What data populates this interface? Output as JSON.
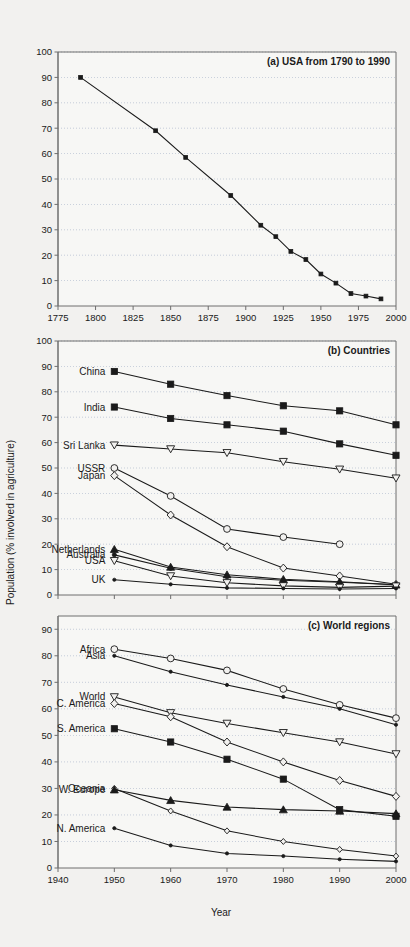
{
  "figure": {
    "y_axis_label": "Population (% involved in agriculture)",
    "x_axis_label": "Year"
  },
  "chart_data": [
    {
      "type": "line",
      "panel_id": "a",
      "title": "(a) USA from 1790 to 1990",
      "xlabel": "",
      "ylabel": "Population (% involved in agriculture)",
      "xlim": [
        1775,
        2000
      ],
      "ylim": [
        0,
        100
      ],
      "xticks": [
        1775,
        1800,
        1825,
        1850,
        1875,
        1900,
        1925,
        1950,
        1975,
        2000
      ],
      "yticks": [
        0,
        10,
        20,
        30,
        40,
        50,
        60,
        70,
        80,
        90,
        100
      ],
      "grid": "horizontal-dotted",
      "legend": "none",
      "series": [
        {
          "name": "USA",
          "marker": "filled-square-small",
          "x": [
            1790,
            1840,
            1860,
            1890,
            1910,
            1920,
            1930,
            1940,
            1950,
            1960,
            1970,
            1980,
            1990
          ],
          "values": [
            90.0,
            69.0,
            58.5,
            43.5,
            31.8,
            27.3,
            21.5,
            18.3,
            12.6,
            9.0,
            4.9,
            3.9,
            2.8
          ]
        }
      ]
    },
    {
      "type": "line",
      "panel_id": "b",
      "title": "(b) Countries",
      "xlabel": "",
      "ylabel": "Population (% involved in agriculture)",
      "xlim": [
        1940,
        2000
      ],
      "ylim": [
        0,
        100
      ],
      "xticks": [
        1940,
        1950,
        1960,
        1970,
        1980,
        1990,
        2000
      ],
      "yticks": [
        0,
        10,
        20,
        30,
        40,
        50,
        60,
        70,
        80,
        90,
        100
      ],
      "grid": "horizontal-dotted",
      "legend": "inline-left-labels",
      "categories": [
        1950,
        1960,
        1970,
        1980,
        1990,
        2000
      ],
      "series": [
        {
          "name": "China",
          "marker": "filled-square",
          "label_y": 88.0,
          "x": [
            1950,
            1960,
            1970,
            1980,
            1990,
            2000
          ],
          "values": [
            88.0,
            83.0,
            78.5,
            74.5,
            72.5,
            67.0
          ]
        },
        {
          "name": "India",
          "marker": "filled-square",
          "label_y": 74.0,
          "x": [
            1950,
            1960,
            1970,
            1980,
            1990,
            2000
          ],
          "values": [
            74.0,
            69.5,
            67.0,
            64.5,
            59.5,
            55.0
          ]
        },
        {
          "name": "Sri Lanka",
          "marker": "open-triangle-down",
          "label_y": 59.0,
          "x": [
            1950,
            1960,
            1970,
            1980,
            1990,
            2000
          ],
          "values": [
            59.0,
            57.5,
            56.0,
            52.5,
            49.5,
            46.0
          ]
        },
        {
          "name": "USSR",
          "marker": "open-circle",
          "label_y": 50.0,
          "x": [
            1950,
            1960,
            1970,
            1980,
            1990
          ],
          "values": [
            50.0,
            39.0,
            26.0,
            22.8,
            20.0
          ]
        },
        {
          "name": "Japan",
          "marker": "open-diamond",
          "label_y": 47.0,
          "x": [
            1950,
            1960,
            1970,
            1980,
            1990,
            2000
          ],
          "values": [
            47.0,
            31.5,
            19.0,
            10.6,
            7.5,
            4.2
          ]
        },
        {
          "name": "Netherlands",
          "marker": "filled-triangle-up",
          "label_y": 18.0,
          "x": [
            1950,
            1960,
            1970,
            1980,
            1990,
            2000
          ],
          "values": [
            18.0,
            11.0,
            8.0,
            6.2,
            5.2,
            4.0
          ]
        },
        {
          "name": "Australia",
          "marker": "filled-circle-small",
          "label_y": 15.8,
          "x": [
            1950,
            1960,
            1970,
            1980,
            1990,
            2000
          ],
          "values": [
            15.8,
            10.5,
            7.2,
            5.8,
            5.0,
            4.0
          ]
        },
        {
          "name": "USA",
          "marker": "open-triangle-down",
          "label_y": 13.5,
          "x": [
            1950,
            1960,
            1970,
            1980,
            1990,
            2000
          ],
          "values": [
            13.5,
            7.5,
            4.8,
            3.6,
            3.0,
            3.5
          ]
        },
        {
          "name": "UK",
          "marker": "filled-dot",
          "label_y": 6.0,
          "x": [
            1950,
            1960,
            1970,
            1980,
            1990,
            2000
          ],
          "values": [
            6.0,
            4.2,
            2.8,
            2.6,
            2.4,
            2.6
          ]
        }
      ]
    },
    {
      "type": "line",
      "panel_id": "c",
      "title": "(c)  World regions",
      "xlabel": "Year",
      "ylabel": "Population (% involved in agriculture)",
      "xlim": [
        1940,
        2000
      ],
      "ylim": [
        0,
        95
      ],
      "xticks": [
        1940,
        1950,
        1960,
        1970,
        1980,
        1990,
        2000
      ],
      "yticks": [
        0,
        10,
        20,
        30,
        40,
        50,
        60,
        70,
        80,
        90
      ],
      "grid": "horizontal-dotted",
      "legend": "inline-left-labels",
      "categories": [
        1950,
        1960,
        1970,
        1980,
        1990,
        2000
      ],
      "series": [
        {
          "name": "Africa",
          "marker": "open-circle",
          "label_y": 82.5,
          "x": [
            1950,
            1960,
            1970,
            1980,
            1990,
            2000
          ],
          "values": [
            82.5,
            79.0,
            74.5,
            67.5,
            61.5,
            56.5
          ]
        },
        {
          "name": "Asia",
          "marker": "filled-dot",
          "label_y": 80.0,
          "x": [
            1950,
            1960,
            1970,
            1980,
            1990,
            2000
          ],
          "values": [
            80.0,
            74.0,
            69.0,
            64.5,
            60.0,
            54.0
          ]
        },
        {
          "name": "World",
          "marker": "open-triangle-down",
          "label_y": 64.5,
          "x": [
            1950,
            1960,
            1970,
            1980,
            1990,
            2000
          ],
          "values": [
            64.5,
            58.5,
            54.5,
            51.0,
            47.5,
            43.0
          ]
        },
        {
          "name": "C. America",
          "marker": "open-diamond",
          "label_y": 62.0,
          "x": [
            1950,
            1960,
            1970,
            1980,
            1990,
            2000
          ],
          "values": [
            62.0,
            57.0,
            47.5,
            40.0,
            33.0,
            27.0
          ]
        },
        {
          "name": "S. America",
          "marker": "filled-square",
          "label_y": 52.5,
          "x": [
            1950,
            1960,
            1970,
            1980,
            1990,
            2000
          ],
          "values": [
            52.5,
            47.5,
            41.0,
            33.5,
            22.0,
            19.5
          ]
        },
        {
          "name": "Oceania",
          "marker": "open-diamond-small",
          "label_y": 30.0,
          "x": [
            1950,
            1960,
            1970,
            1980,
            1990,
            2000
          ],
          "values": [
            30.0,
            21.5,
            14.0,
            10.0,
            7.0,
            4.5
          ]
        },
        {
          "name": "W. Europe",
          "marker": "filled-triangle-up",
          "label_y": 29.5,
          "x": [
            1950,
            1960,
            1970,
            1980,
            1990,
            2000
          ],
          "values": [
            29.5,
            25.5,
            23.0,
            22.0,
            21.5,
            20.5
          ]
        },
        {
          "name": "N. America",
          "marker": "filled-dot",
          "label_y": 15.0,
          "x": [
            1950,
            1960,
            1970,
            1980,
            1990,
            2000
          ],
          "values": [
            15.0,
            8.5,
            5.5,
            4.5,
            3.3,
            2.5
          ]
        }
      ]
    }
  ]
}
